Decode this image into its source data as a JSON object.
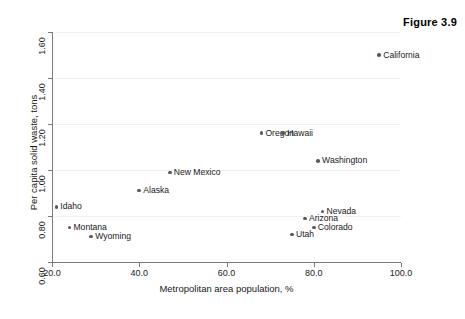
{
  "figure": {
    "title": "Figure 3.9"
  },
  "chart_data": {
    "type": "scatter",
    "title": "Figure 3.9",
    "xlabel": "Metropolitan area population, %",
    "ylabel": "Per capita solid waste, tons",
    "xlim": [
      20.0,
      100.0
    ],
    "ylim": [
      0.6,
      1.6
    ],
    "xticks": [
      "20.0",
      "40.0",
      "60.0",
      "80.0",
      "100.0"
    ],
    "xtick_values": [
      20.0,
      40.0,
      60.0,
      80.0,
      100.0
    ],
    "yticks": [
      "0.60",
      "0.80",
      "1.00",
      "1.20",
      "1.40",
      "1.60"
    ],
    "ytick_values": [
      0.6,
      0.8,
      1.0,
      1.2,
      1.4,
      1.6
    ],
    "grid": true,
    "legend": "none",
    "marker_color": "#5a5a5a",
    "axis_color": "#7a7a7a",
    "points": [
      {
        "label": "California",
        "x": 95.0,
        "y": 1.5,
        "label_side": "right"
      },
      {
        "label": "Oregon",
        "x": 68.0,
        "y": 1.16,
        "label_side": "right"
      },
      {
        "label": "Hawaii",
        "x": 73.0,
        "y": 1.16,
        "label_side": "right"
      },
      {
        "label": "Washington",
        "x": 81.0,
        "y": 1.04,
        "label_side": "right"
      },
      {
        "label": "New Mexico",
        "x": 47.0,
        "y": 0.99,
        "label_side": "right"
      },
      {
        "label": "Alaska",
        "x": 40.0,
        "y": 0.91,
        "label_side": "right"
      },
      {
        "label": "Idaho",
        "x": 21.0,
        "y": 0.84,
        "label_side": "right"
      },
      {
        "label": "Nevada",
        "x": 82.0,
        "y": 0.82,
        "label_side": "right"
      },
      {
        "label": "Arizona",
        "x": 78.0,
        "y": 0.79,
        "label_side": "right"
      },
      {
        "label": "Colorado",
        "x": 80.0,
        "y": 0.75,
        "label_side": "right"
      },
      {
        "label": "Montana",
        "x": 24.0,
        "y": 0.75,
        "label_side": "right"
      },
      {
        "label": "Utah",
        "x": 75.0,
        "y": 0.72,
        "label_side": "right"
      },
      {
        "label": "Wyoming",
        "x": 29.0,
        "y": 0.71,
        "label_side": "right"
      }
    ]
  }
}
